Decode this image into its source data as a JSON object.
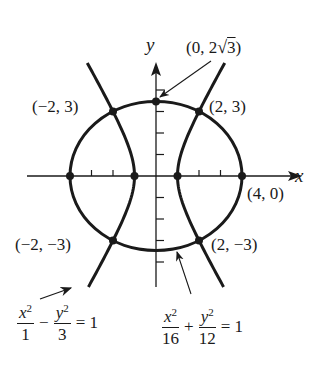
{
  "figure": {
    "axes": {
      "x_label": "x",
      "y_label": "y",
      "origin_px": [
        156,
        176
      ],
      "scale_px_per_unit": 21.5,
      "x_ticks": [
        -4,
        -3,
        -2,
        -1,
        1,
        2,
        3,
        4
      ],
      "y_ticks": [
        -4,
        -3,
        -2,
        -1,
        1,
        2,
        3,
        4
      ],
      "x_range": [
        -6.8,
        7.8
      ],
      "y_range": [
        -5.1,
        5.3
      ]
    },
    "curves": {
      "ellipse": {
        "equation": "x^2/16 + y^2/12 = 1",
        "a": 4,
        "b2": 12
      },
      "hyperbola": {
        "equation": "x^2/1 - y^2/3 = 1",
        "a2": 1,
        "b2": 3,
        "y_min": -5.16,
        "y_max": 5.26
      }
    },
    "points": [
      {
        "label": "(0, 2√3)",
        "x": 0,
        "y": 3.4641
      },
      {
        "label": "(−2, 3)",
        "x": -2,
        "y": 3
      },
      {
        "label": "(2, 3)",
        "x": 2,
        "y": 3
      },
      {
        "label": "(−2, −3)",
        "x": -2,
        "y": -3
      },
      {
        "label": "(2, −3)",
        "x": 2,
        "y": -3
      },
      {
        "label": "(4, 0)",
        "x": 4,
        "y": 0
      },
      {
        "label": "",
        "x": -4,
        "y": 0
      },
      {
        "label": "",
        "x": -1,
        "y": 0
      },
      {
        "label": "",
        "x": 1,
        "y": 0
      }
    ],
    "labels": {
      "top_point": "(0, 2√3)",
      "top_point_prefix": "(0, 2",
      "top_point_radicand": "3",
      "top_point_suffix": ")",
      "upper_left": "(−2, 3)",
      "upper_right": "(2, 3)",
      "lower_left": "(−2, −3)",
      "lower_right": "(2, −3)",
      "right_vertex": "(4, 0)"
    },
    "hyperbola_equation": {
      "num1_var": "x",
      "num1_exp": "2",
      "den1": "1",
      "operator": "−",
      "num2_var": "y",
      "num2_exp": "2",
      "den2": "3",
      "equals": "= 1"
    },
    "ellipse_equation": {
      "num1_var": "x",
      "num1_exp": "2",
      "den1": "16",
      "operator": "+",
      "num2_var": "y",
      "num2_exp": "2",
      "den2": "12",
      "equals": "= 1"
    },
    "colors": {
      "ink": "#1a1a1a",
      "background": "#ffffff"
    }
  }
}
